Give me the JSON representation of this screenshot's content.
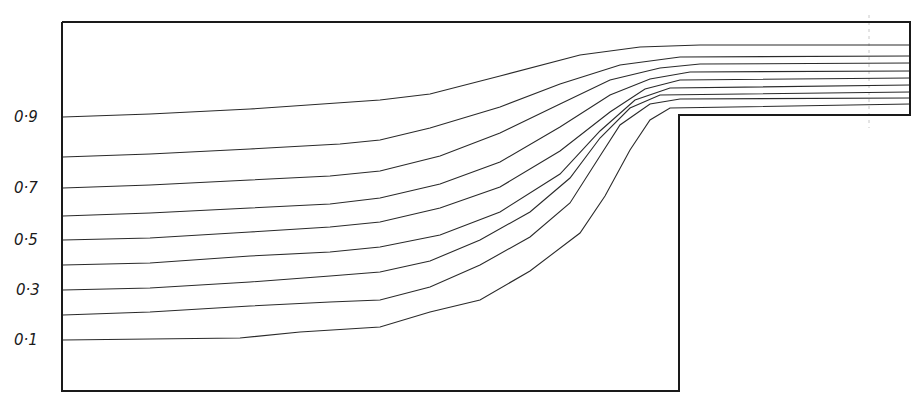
{
  "diagram": {
    "type": "streamline-plot",
    "colors": {
      "line": "#2a2a2a",
      "wall": "#1a1a1a",
      "background": "#ffffff"
    },
    "boundary": {
      "points": [
        [
          62,
          22
        ],
        [
          910,
          22
        ],
        [
          910,
          115
        ],
        [
          679,
          115
        ],
        [
          679,
          391
        ],
        [
          62,
          391
        ],
        [
          62,
          22
        ]
      ]
    },
    "axis_labels": [
      {
        "text": "0·9",
        "x": 14,
        "y": 122
      },
      {
        "text": "0·7",
        "x": 14,
        "y": 193
      },
      {
        "text": "0·5",
        "x": 14,
        "y": 245
      },
      {
        "text": "0·3",
        "x": 16,
        "y": 295
      },
      {
        "text": "0·1",
        "x": 14,
        "y": 345
      }
    ],
    "streamlines": [
      {
        "value": "0.9",
        "points": [
          [
            63,
            117
          ],
          [
            150,
            114
          ],
          [
            250,
            109
          ],
          [
            380,
            100
          ],
          [
            430,
            94
          ],
          [
            500,
            76
          ],
          [
            580,
            55
          ],
          [
            640,
            47
          ],
          [
            700,
            45
          ],
          [
            910,
            45
          ]
        ]
      },
      {
        "value": "0.8",
        "points": [
          [
            63,
            157
          ],
          [
            150,
            154
          ],
          [
            250,
            149
          ],
          [
            340,
            144
          ],
          [
            380,
            140
          ],
          [
            430,
            128
          ],
          [
            500,
            107
          ],
          [
            560,
            84
          ],
          [
            620,
            65
          ],
          [
            680,
            57
          ],
          [
            910,
            56
          ]
        ]
      },
      {
        "value": "0.7",
        "points": [
          [
            63,
            188
          ],
          [
            150,
            185
          ],
          [
            250,
            180
          ],
          [
            330,
            176
          ],
          [
            380,
            171
          ],
          [
            440,
            156
          ],
          [
            500,
            133
          ],
          [
            560,
            104
          ],
          [
            610,
            80
          ],
          [
            660,
            68
          ],
          [
            700,
            64
          ],
          [
            910,
            63
          ]
        ]
      },
      {
        "value": "0.6",
        "points": [
          [
            63,
            216
          ],
          [
            150,
            213
          ],
          [
            250,
            208
          ],
          [
            330,
            204
          ],
          [
            380,
            198
          ],
          [
            440,
            184
          ],
          [
            500,
            162
          ],
          [
            560,
            127
          ],
          [
            610,
            95
          ],
          [
            650,
            79
          ],
          [
            690,
            72
          ],
          [
            910,
            71
          ]
        ]
      },
      {
        "value": "0.5",
        "points": [
          [
            63,
            240
          ],
          [
            150,
            238
          ],
          [
            250,
            232
          ],
          [
            330,
            227
          ],
          [
            380,
            222
          ],
          [
            440,
            208
          ],
          [
            500,
            187
          ],
          [
            560,
            151
          ],
          [
            610,
            112
          ],
          [
            645,
            89
          ],
          [
            680,
            80
          ],
          [
            910,
            78
          ]
        ]
      },
      {
        "value": "0.4",
        "points": [
          [
            63,
            265
          ],
          [
            150,
            263
          ],
          [
            250,
            256
          ],
          [
            330,
            252
          ],
          [
            380,
            247
          ],
          [
            440,
            235
          ],
          [
            500,
            212
          ],
          [
            560,
            174
          ],
          [
            600,
            131
          ],
          [
            635,
            100
          ],
          [
            670,
            88
          ],
          [
            910,
            85
          ]
        ]
      },
      {
        "value": "0.3",
        "points": [
          [
            63,
            290
          ],
          [
            150,
            288
          ],
          [
            250,
            282
          ],
          [
            330,
            276
          ],
          [
            380,
            272
          ],
          [
            430,
            261
          ],
          [
            480,
            240
          ],
          [
            530,
            212
          ],
          [
            570,
            178
          ],
          [
            600,
            138
          ],
          [
            630,
            108
          ],
          [
            660,
            95
          ],
          [
            910,
            92
          ]
        ]
      },
      {
        "value": "0.2",
        "points": [
          [
            63,
            315
          ],
          [
            150,
            312
          ],
          [
            250,
            306
          ],
          [
            330,
            302
          ],
          [
            380,
            300
          ],
          [
            430,
            287
          ],
          [
            480,
            265
          ],
          [
            530,
            237
          ],
          [
            570,
            203
          ],
          [
            600,
            156
          ],
          [
            620,
            125
          ],
          [
            650,
            104
          ],
          [
            680,
            99
          ],
          [
            910,
            98
          ]
        ]
      },
      {
        "value": "0.1",
        "points": [
          [
            63,
            340
          ],
          [
            150,
            339
          ],
          [
            240,
            338
          ],
          [
            300,
            332
          ],
          [
            380,
            327
          ],
          [
            430,
            312
          ],
          [
            480,
            300
          ],
          [
            530,
            271
          ],
          [
            580,
            233
          ],
          [
            605,
            196
          ],
          [
            630,
            150
          ],
          [
            650,
            120
          ],
          [
            670,
            108
          ],
          [
            910,
            104
          ]
        ]
      }
    ],
    "annotations": {
      "faint_dashed_vertical": {
        "x": 869,
        "y1": 15,
        "y2": 128
      }
    }
  }
}
